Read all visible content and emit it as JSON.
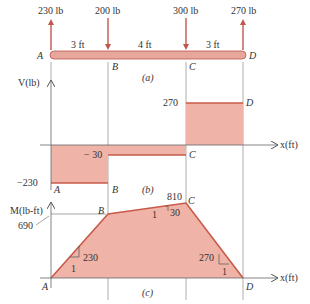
{
  "colors": {
    "fill": "#efb3a8",
    "line": "#c85a4a",
    "arrow": "#c0574a",
    "beam": "#e8a79c",
    "guide": "#9a9a9a",
    "text": "#333333"
  },
  "beam": {
    "points": [
      "A",
      "B",
      "C",
      "D"
    ],
    "positions_ft": [
      0,
      3,
      7,
      10
    ],
    "segment_labels": [
      "3 ft",
      "4 ft",
      "3 ft"
    ],
    "loads": [
      {
        "label": "230 lb",
        "at": "A",
        "direction": "up"
      },
      {
        "label": "200 lb",
        "at": "B",
        "direction": "down"
      },
      {
        "label": "300 lb",
        "at": "C",
        "direction": "down"
      },
      {
        "label": "270 lb",
        "at": "D",
        "direction": "up"
      }
    ],
    "caption": "(a)"
  },
  "shear": {
    "axis_label": "V(lb)",
    "x_label": "x(ft)",
    "values": {
      "AB": -230,
      "BC": -30,
      "CD": 270
    },
    "tick_labels": [
      "270",
      "− 30",
      "−230"
    ],
    "point_labels": {
      "A": "A",
      "B": "B",
      "C": "C",
      "D": "D"
    },
    "caption": "(b)"
  },
  "moment": {
    "axis_label": "M(lb-ft)",
    "x_label": "x(ft)",
    "values": {
      "A": 0,
      "B": 690,
      "C": 810,
      "D": 0
    },
    "tick_labels": [
      "690",
      "810"
    ],
    "slopes": [
      {
        "rise": "230",
        "run": "1"
      },
      {
        "rise": "30",
        "run": "1"
      },
      {
        "rise": "270",
        "run": "1"
      }
    ],
    "point_labels": {
      "A": "A",
      "B": "B",
      "C": "C",
      "D": "D"
    },
    "caption": "(c)"
  }
}
